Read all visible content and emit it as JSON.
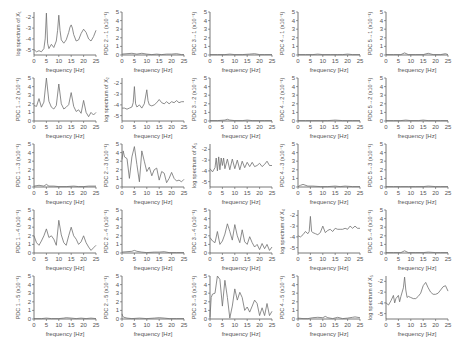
{
  "figure": {
    "xlabel": "frequency [Hz]",
    "xticks": [
      0,
      5,
      10,
      15,
      20,
      25
    ],
    "xlim": [
      0,
      25
    ],
    "line_color": "#707070",
    "axis_color": "#555555"
  },
  "chart_data": [
    {
      "row": 1,
      "col": 1,
      "type": "line",
      "kind": "spectrum",
      "ylabel": "log spectrum of X₁",
      "ylim": [
        -5.5,
        -1.5
      ],
      "yticks": [
        -5,
        -4,
        -3,
        -2
      ],
      "x": [
        0,
        1,
        2,
        3,
        4,
        4.5,
        5,
        5.5,
        6,
        7,
        8,
        9,
        9.5,
        10,
        10.5,
        11,
        12,
        13,
        14,
        14.5,
        15,
        15.5,
        16,
        17,
        18,
        19,
        20,
        21,
        22,
        23,
        24,
        25
      ],
      "y": [
        -5,
        -5.2,
        -5.1,
        -5.2,
        -4.9,
        -4,
        -1.6,
        -4.4,
        -4.9,
        -4.5,
        -4.8,
        -4.2,
        -3.2,
        -1.8,
        -3.2,
        -4.1,
        -4.4,
        -4.1,
        -3.4,
        -2.9,
        -2.7,
        -3,
        -3.6,
        -4.2,
        -4.1,
        -3.5,
        -3.1,
        -3.4,
        -4,
        -4.2,
        -3.8,
        -3.2
      ]
    },
    {
      "row": 1,
      "col": 2,
      "type": "line",
      "kind": "pdc",
      "ylabel": "PDC 2→1 (x10⁻¹)",
      "ylim": [
        0,
        5
      ],
      "yticks": [
        0,
        1,
        2,
        3,
        4,
        5
      ],
      "x": [
        0,
        2,
        4,
        6,
        8,
        10,
        12,
        14,
        16,
        18,
        20,
        22,
        24,
        25
      ],
      "y": [
        0.1,
        0.15,
        0.2,
        0.1,
        0.2,
        0.1,
        0.05,
        0.1,
        0.05,
        0.1,
        0.1,
        0.15,
        0.05,
        0.05
      ]
    },
    {
      "row": 1,
      "col": 3,
      "type": "line",
      "kind": "pdc",
      "ylabel": "PDC 3→1 (x10⁻¹)",
      "ylim": [
        0,
        5
      ],
      "yticks": [
        0,
        1,
        2,
        3,
        4,
        5
      ],
      "x": [
        0,
        3,
        6,
        8,
        10,
        13,
        16,
        18,
        20,
        22,
        25
      ],
      "y": [
        0.05,
        0.05,
        0.05,
        0.1,
        0.05,
        0.05,
        0.1,
        0.15,
        0.05,
        0.05,
        0.05
      ]
    },
    {
      "row": 1,
      "col": 4,
      "type": "line",
      "kind": "pdc",
      "ylabel": "PDC 4→1 (x10⁻¹)",
      "ylim": [
        0,
        5
      ],
      "yticks": [
        0,
        1,
        2,
        3,
        4,
        5
      ],
      "x": [
        0,
        3,
        6,
        8,
        10,
        13,
        16,
        18,
        20,
        22,
        25
      ],
      "y": [
        0.05,
        0.05,
        0.05,
        0.1,
        0.05,
        0.05,
        0.05,
        0.05,
        0.1,
        0.05,
        0.05
      ]
    },
    {
      "row": 1,
      "col": 5,
      "type": "line",
      "kind": "pdc",
      "ylabel": "PDC 5→1 (x10⁻¹)",
      "ylim": [
        0,
        5
      ],
      "yticks": [
        0,
        1,
        2,
        3,
        4,
        5
      ],
      "x": [
        0,
        3,
        6,
        7.5,
        9,
        12,
        15,
        17,
        19,
        22,
        24,
        25
      ],
      "y": [
        0.05,
        0.05,
        0.05,
        0.25,
        0.05,
        0.05,
        0.05,
        0.2,
        0.05,
        0.05,
        0.15,
        0.05
      ]
    },
    {
      "row": 2,
      "col": 1,
      "type": "line",
      "kind": "pdc",
      "ylabel": "PDC 1→2 (x10⁻¹)",
      "ylim": [
        0,
        5
      ],
      "yticks": [
        0,
        1,
        2,
        3,
        4,
        5
      ],
      "x": [
        0,
        1,
        2,
        3,
        4,
        5,
        6,
        7,
        8,
        9,
        10,
        11,
        12,
        13,
        14,
        15,
        16,
        17,
        18,
        19,
        20,
        21,
        22,
        23,
        24,
        25
      ],
      "y": [
        1.8,
        1.7,
        2.6,
        1.6,
        2.2,
        5.1,
        2.3,
        1.6,
        1.4,
        1.8,
        4.3,
        2.0,
        1.4,
        1.6,
        1.9,
        3.3,
        1.7,
        1.1,
        1.3,
        0.9,
        2.4,
        1.0,
        0.5,
        1.0,
        0.7,
        1.0
      ]
    },
    {
      "row": 2,
      "col": 2,
      "type": "line",
      "kind": "spectrum",
      "ylabel": "log spectrum of X₂",
      "ylim": [
        -5.5,
        -1.5
      ],
      "yticks": [
        -5,
        -4,
        -3,
        -2
      ],
      "x": [
        0,
        1,
        2,
        3,
        4,
        4.5,
        5,
        5.5,
        6,
        7,
        8,
        9,
        10,
        10.5,
        11,
        12,
        13,
        14,
        15,
        16,
        17,
        18,
        19,
        20,
        21,
        22,
        23,
        24,
        25
      ],
      "y": [
        -4.3,
        -4.3,
        -4.4,
        -4.3,
        -4.2,
        -3.8,
        -2.3,
        -3.9,
        -4.2,
        -4.0,
        -4.3,
        -3.9,
        -2.6,
        -3.6,
        -4.0,
        -4.1,
        -4.0,
        -3.8,
        -3.5,
        -3.8,
        -3.9,
        -3.7,
        -3.9,
        -3.7,
        -3.8,
        -3.6,
        -3.8,
        -3.7,
        -3.7
      ]
    },
    {
      "row": 2,
      "col": 3,
      "type": "line",
      "kind": "pdc",
      "ylabel": "PDC 3→2 (x10⁻¹)",
      "ylim": [
        0,
        5
      ],
      "yticks": [
        0,
        1,
        2,
        3,
        4,
        5
      ],
      "x": [
        0,
        3,
        6,
        7,
        8,
        10,
        13,
        15,
        17,
        20,
        22,
        25
      ],
      "y": [
        0.05,
        0.05,
        0.1,
        0.2,
        0.1,
        0.05,
        0.05,
        0.1,
        0.05,
        0.05,
        0.05,
        0.05
      ]
    },
    {
      "row": 2,
      "col": 4,
      "type": "line",
      "kind": "pdc",
      "ylabel": "PDC 4→2 (x10⁻¹)",
      "ylim": [
        0,
        5
      ],
      "yticks": [
        0,
        1,
        2,
        3,
        4,
        5
      ],
      "x": [
        0,
        3,
        6,
        9,
        12,
        15,
        18,
        20,
        22,
        25
      ],
      "y": [
        0.05,
        0.05,
        0.05,
        0.05,
        0.05,
        0.1,
        0.05,
        0.05,
        0.05,
        0.05
      ]
    },
    {
      "row": 2,
      "col": 5,
      "type": "line",
      "kind": "pdc",
      "ylabel": "PDC 5→2 (x10⁻¹)",
      "ylim": [
        0,
        5
      ],
      "yticks": [
        0,
        1,
        2,
        3,
        4,
        5
      ],
      "x": [
        0,
        3,
        6,
        8,
        10,
        13,
        15,
        17,
        20,
        22,
        25
      ],
      "y": [
        0.05,
        0.05,
        0.05,
        0.1,
        0.05,
        0.05,
        0.1,
        0.05,
        0.05,
        0.05,
        0.05
      ]
    },
    {
      "row": 3,
      "col": 1,
      "type": "line",
      "kind": "pdc",
      "ylabel": "PDC 1→3 (x10⁻¹)",
      "ylim": [
        0,
        5
      ],
      "yticks": [
        0,
        1,
        2,
        3,
        4,
        5
      ],
      "x": [
        0,
        2,
        4,
        5,
        6,
        8,
        10,
        13,
        16,
        18,
        20,
        22,
        25
      ],
      "y": [
        0.1,
        0.2,
        0.1,
        0.3,
        0.1,
        0.1,
        0.05,
        0.05,
        0.1,
        0.05,
        0.05,
        0.1,
        0.1
      ]
    },
    {
      "row": 3,
      "col": 2,
      "type": "line",
      "kind": "pdc",
      "ylabel": "PDC 2→3 (x10⁻¹)",
      "ylim": [
        0,
        5
      ],
      "yticks": [
        0,
        1,
        2,
        3,
        4,
        5
      ],
      "x": [
        0,
        0.5,
        1,
        2,
        3,
        4,
        5,
        6,
        7,
        8,
        9,
        10,
        11,
        12,
        13,
        14,
        15,
        16,
        17,
        18,
        19,
        20,
        21,
        22,
        23,
        24,
        25
      ],
      "y": [
        3.2,
        4.2,
        3.5,
        3.3,
        1.0,
        3.5,
        4.7,
        2.6,
        0.6,
        4.2,
        3.0,
        1.8,
        2.3,
        1.3,
        2.0,
        2.2,
        0.8,
        1.8,
        1.6,
        0.5,
        1.0,
        1.7,
        1.0,
        0.7,
        0.8,
        0.6,
        0.9
      ]
    },
    {
      "row": 3,
      "col": 3,
      "type": "line",
      "kind": "spectrum",
      "ylabel": "log spectrum of X₃",
      "ylim": [
        -5.5,
        -1.5
      ],
      "yticks": [
        -5,
        -4,
        -3,
        -2
      ],
      "x": [
        0,
        1,
        2,
        2.5,
        3,
        3.5,
        4,
        4.5,
        5,
        5.5,
        6,
        7,
        8,
        9,
        10,
        11,
        12,
        13,
        14,
        15,
        16,
        17,
        18,
        19,
        20,
        21,
        22,
        23,
        24,
        25
      ],
      "y": [
        -3.8,
        -4.1,
        -3.7,
        -2.8,
        -4.0,
        -2.7,
        -3.9,
        -2.8,
        -3.5,
        -2.8,
        -3.8,
        -2.9,
        -3.9,
        -2.9,
        -3.8,
        -3.0,
        -3.9,
        -3.1,
        -3.7,
        -3.2,
        -3.6,
        -3.2,
        -3.6,
        -3.5,
        -3.3,
        -3.6,
        -3.4,
        -3.1,
        -3.5,
        -3.5
      ]
    },
    {
      "row": 3,
      "col": 4,
      "type": "line",
      "kind": "pdc",
      "ylabel": "PDC 4→3 (x10⁻¹)",
      "ylim": [
        0,
        5
      ],
      "yticks": [
        0,
        1,
        2,
        3,
        4,
        5
      ],
      "x": [
        0,
        1,
        2,
        4,
        6,
        9,
        12,
        15,
        17,
        19,
        22,
        25
      ],
      "y": [
        0.05,
        0.2,
        0.3,
        0.1,
        0.1,
        0.05,
        0.05,
        0.1,
        0.05,
        0.1,
        0.05,
        0.05
      ]
    },
    {
      "row": 3,
      "col": 5,
      "type": "line",
      "kind": "pdc",
      "ylabel": "PDC 5→3 (x10⁻¹)",
      "ylim": [
        0,
        5
      ],
      "yticks": [
        0,
        1,
        2,
        3,
        4,
        5
      ],
      "x": [
        0,
        3,
        6,
        9,
        12,
        15,
        17,
        20,
        22,
        25
      ],
      "y": [
        0.05,
        0.05,
        0.05,
        0.05,
        0.05,
        0.05,
        0.1,
        0.05,
        0.05,
        0.05
      ]
    },
    {
      "row": 4,
      "col": 1,
      "type": "line",
      "kind": "pdc",
      "ylabel": "PDC 1→4 (x10⁻¹)",
      "ylim": [
        0,
        5
      ],
      "yticks": [
        0,
        1,
        2,
        3,
        4,
        5
      ],
      "x": [
        0,
        1,
        2,
        3,
        4,
        5,
        6,
        7,
        8,
        9,
        10,
        11,
        12,
        13,
        14,
        15,
        16,
        17,
        18,
        19,
        20,
        21,
        22,
        23,
        24,
        25
      ],
      "y": [
        2.0,
        1.2,
        0.9,
        1.4,
        2.0,
        2.8,
        1.8,
        2.0,
        1.6,
        0.9,
        3.8,
        2.1,
        1.2,
        0.9,
        2.0,
        3.0,
        2.0,
        1.6,
        1.0,
        1.3,
        2.0,
        1.2,
        0.7,
        0.3,
        0.6,
        0.9
      ]
    },
    {
      "row": 4,
      "col": 2,
      "type": "line",
      "kind": "pdc",
      "ylabel": "PDC 2→4 (x10⁻¹)",
      "ylim": [
        0,
        5
      ],
      "yticks": [
        0,
        1,
        2,
        3,
        4,
        5
      ],
      "x": [
        0,
        2,
        4,
        5,
        6,
        8,
        10,
        13,
        15,
        17,
        19,
        22,
        25
      ],
      "y": [
        0.1,
        0.15,
        0.2,
        0.3,
        0.2,
        0.1,
        0.05,
        0.1,
        0.1,
        0.15,
        0.05,
        0.05,
        0.05
      ]
    },
    {
      "row": 4,
      "col": 3,
      "type": "line",
      "kind": "pdc",
      "ylabel": "PDC 3→4 (x10⁻¹)",
      "ylim": [
        0,
        5
      ],
      "yticks": [
        0,
        1,
        2,
        3,
        4,
        5
      ],
      "x": [
        0,
        1,
        2,
        3,
        4,
        5,
        6,
        7,
        8,
        9,
        10,
        11,
        12,
        13,
        14,
        15,
        16,
        17,
        18,
        19,
        20,
        21,
        22,
        23,
        24,
        25
      ],
      "y": [
        1.8,
        1.4,
        1.2,
        2.5,
        1.0,
        1.4,
        2.2,
        3.4,
        2.5,
        1.5,
        3.3,
        2.0,
        1.2,
        2.7,
        1.3,
        1.0,
        1.9,
        1.2,
        0.7,
        1.0,
        0.4,
        1.1,
        0.5,
        1.0,
        0.3,
        0.7
      ]
    },
    {
      "row": 4,
      "col": 4,
      "type": "line",
      "kind": "spectrum",
      "ylabel": "log spectrum of X₄",
      "ylim": [
        -5.5,
        -1.5
      ],
      "yticks": [
        -5,
        -4,
        -3,
        -2
      ],
      "x": [
        0,
        1,
        2,
        3,
        4,
        4.5,
        5,
        5.5,
        6,
        7,
        8,
        9,
        10,
        11,
        12,
        13,
        14,
        15,
        16,
        17,
        18,
        19,
        20,
        21,
        22,
        23,
        24,
        25
      ],
      "y": [
        -3.9,
        -4.0,
        -3.8,
        -3.5,
        -3.7,
        -3.5,
        -2.1,
        -3.5,
        -3.6,
        -3.7,
        -3.8,
        -3.6,
        -3.0,
        -3.6,
        -3.4,
        -3.3,
        -3.5,
        -3.2,
        -3.3,
        -3.3,
        -3.3,
        -3.2,
        -3.3,
        -3.0,
        -3.2,
        -3.0,
        -3.2,
        -3.2
      ]
    },
    {
      "row": 4,
      "col": 5,
      "type": "line",
      "kind": "pdc",
      "ylabel": "PDC 5→4 (x10⁻¹)",
      "ylim": [
        0,
        5
      ],
      "yticks": [
        0,
        1,
        2,
        3,
        4,
        5
      ],
      "x": [
        0,
        3,
        6,
        7.5,
        9,
        12,
        15,
        17,
        20,
        22,
        25
      ],
      "y": [
        0.05,
        0.05,
        0.05,
        0.25,
        0.05,
        0.05,
        0.05,
        0.1,
        0.05,
        0.05,
        0.05
      ]
    },
    {
      "row": 5,
      "col": 1,
      "type": "line",
      "kind": "pdc",
      "ylabel": "PDC 1→5 (x10⁻¹)",
      "ylim": [
        0,
        5
      ],
      "yticks": [
        0,
        1,
        2,
        3,
        4,
        5
      ],
      "x": [
        0,
        3,
        5,
        7,
        10,
        12,
        13,
        15,
        17,
        19,
        21,
        23,
        25
      ],
      "y": [
        0.05,
        0.05,
        0.1,
        0.05,
        0.05,
        0.1,
        0.15,
        0.1,
        0.05,
        0.1,
        0.05,
        0.1,
        0.05
      ]
    },
    {
      "row": 5,
      "col": 2,
      "type": "line",
      "kind": "pdc",
      "ylabel": "PDC 2→5 (x10⁻¹)",
      "ylim": [
        0,
        5
      ],
      "yticks": [
        0,
        1,
        2,
        3,
        4,
        5
      ],
      "x": [
        0,
        0.3,
        0.8,
        2,
        4,
        7,
        10,
        13,
        15,
        17,
        19,
        22,
        25
      ],
      "y": [
        0.6,
        0.3,
        0.2,
        0.1,
        0.05,
        0.1,
        0.05,
        0.1,
        0.15,
        0.1,
        0.05,
        0.05,
        0.05
      ]
    },
    {
      "row": 5,
      "col": 3,
      "type": "line",
      "kind": "pdc",
      "ylabel": "PDC 3→5 (x10⁻¹)",
      "ylim": [
        0,
        5
      ],
      "yticks": [
        0,
        1,
        2,
        3,
        4,
        5
      ],
      "x": [
        0,
        0.5,
        1,
        2,
        3,
        4,
        5,
        6,
        7,
        8,
        9,
        10,
        11,
        12,
        13,
        14,
        15,
        16,
        17,
        18,
        19,
        20,
        21,
        22,
        23,
        24,
        25
      ],
      "y": [
        0.2,
        2.5,
        2.9,
        3.0,
        5.0,
        4.6,
        1.5,
        4.5,
        2.5,
        0.1,
        1.5,
        3.5,
        2.2,
        3.1,
        2.5,
        1.0,
        1.4,
        0.8,
        1.5,
        2.2,
        1.8,
        0.4,
        1.3,
        0.4,
        1.8,
        0.4,
        0.9
      ]
    },
    {
      "row": 5,
      "col": 4,
      "type": "line",
      "kind": "pdc",
      "ylabel": "PDC 4→5 (x10⁻¹)",
      "ylim": [
        0,
        5
      ],
      "yticks": [
        0,
        1,
        2,
        3,
        4,
        5
      ],
      "x": [
        0,
        2,
        4,
        6,
        8,
        10,
        11,
        12,
        14,
        16,
        18,
        20,
        22,
        23,
        25
      ],
      "y": [
        0.1,
        0.05,
        0.05,
        0.15,
        0.2,
        0.15,
        0.3,
        0.15,
        0.05,
        0.2,
        0.05,
        0.1,
        0.2,
        0.25,
        0.15
      ]
    },
    {
      "row": 5,
      "col": 5,
      "type": "line",
      "kind": "spectrum",
      "ylabel": "log spectrum of X₅",
      "ylim": [
        -5.5,
        -1.5
      ],
      "yticks": [
        -5,
        -4,
        -3,
        -2
      ],
      "x": [
        0,
        1,
        2,
        3,
        3.5,
        4,
        5,
        5.5,
        6,
        7,
        7.5,
        8,
        8.5,
        9,
        10,
        11,
        12,
        13,
        14,
        15,
        16,
        17,
        18,
        19,
        20,
        21,
        22,
        23,
        24,
        25
      ],
      "y": [
        -4.0,
        -4.2,
        -3.8,
        -3.3,
        -4.0,
        -3.6,
        -3.3,
        -3.9,
        -3.4,
        -2.6,
        -1.6,
        -2.8,
        -3.5,
        -3.4,
        -3.5,
        -3.6,
        -3.6,
        -3.4,
        -3.1,
        -2.4,
        -2.1,
        -2.6,
        -3.0,
        -3.2,
        -3.2,
        -3.1,
        -2.8,
        -2.5,
        -2.4,
        -2.9
      ]
    }
  ]
}
